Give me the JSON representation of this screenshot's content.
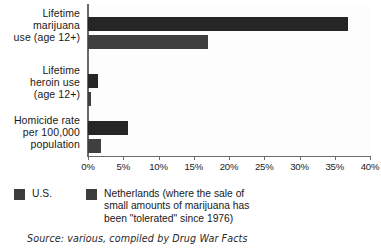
{
  "chart_data": {
    "type": "bar",
    "orientation": "horizontal",
    "title": "",
    "xlabel": "",
    "ylabel": "",
    "categories": [
      "Lifetime\nmarijuana\nuse (age 12+)",
      "Lifetime\nheroin use\n(age 12+)",
      "Homicide rate\nper 100,000\npopulation"
    ],
    "series": [
      {
        "name": "U.S.",
        "color": "#262626",
        "values": [
          36.9,
          1.4,
          5.7
        ]
      },
      {
        "name": "Netherlands",
        "color": "#3f3f3f",
        "values": [
          17.0,
          0.4,
          1.8
        ]
      }
    ],
    "xlim": [
      0,
      40
    ],
    "xticks": [
      0,
      5,
      10,
      15,
      20,
      25,
      30,
      35,
      40
    ],
    "xtick_labels": [
      "0%",
      "5%",
      "10%",
      "15%",
      "20%",
      "25%",
      "30%",
      "35%",
      "40%"
    ],
    "grid": false,
    "legend_position": "bottom"
  },
  "legend": {
    "us_label": "U.S.",
    "nl_label": "Netherlands (where the sale of\nsmall amounts of marijuana has\nbeen \"tolerated\" since 1976)"
  },
  "source": {
    "text": "Source: various, compiled by Drug War Facts"
  }
}
